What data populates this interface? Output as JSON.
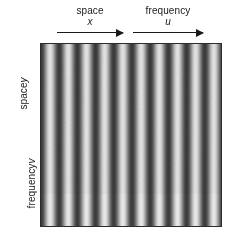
{
  "figure": {
    "background_color": "#ffffff",
    "width": 229,
    "height": 237
  },
  "top_axes": [
    {
      "name": "space-x",
      "word": "space",
      "variable": "x",
      "direction": "right",
      "arrow": {
        "x": 57,
        "y": 30,
        "length": 66
      },
      "label_center_x": 90,
      "label_top_y": 5
    },
    {
      "name": "frequency-u",
      "word": "frequency",
      "variable": "u",
      "direction": "right",
      "arrow": {
        "x": 133,
        "y": 30,
        "length": 70
      },
      "label_center_x": 168,
      "label_top_y": 5
    }
  ],
  "left_axes": [
    {
      "name": "space-y",
      "word": "space",
      "variable": "y",
      "direction": "down",
      "arrow": {
        "x": 27,
        "y": 55,
        "length": 76
      },
      "label_center_y": 95
    },
    {
      "name": "frequency-v",
      "word": "frequency",
      "variable": "v",
      "direction": "down",
      "arrow": {
        "x": 27,
        "y": 142,
        "length": 83
      },
      "label_center_y": 185
    }
  ],
  "grating": {
    "name": "vertical-sinusoidal-grating",
    "box": {
      "x": 40,
      "y": 43,
      "width": 182,
      "height": 184
    },
    "orientation": "vertical-bars",
    "period_px": 18.2,
    "cycles": 10,
    "phase_deg": 0,
    "light_gray": "#e8e8e8",
    "dark_gray": "#3a3a3a",
    "mid_gray": "#b0b0b0",
    "border_color": "#2b2b2b",
    "grain": "film-grain-noise"
  },
  "chart_data": {
    "type": "heatmap",
    "title": "",
    "xlabel": "space x / frequency u",
    "ylabel": "space y / frequency v",
    "x": [
      0,
      18.2,
      36.4,
      54.6,
      72.8,
      91,
      109.2,
      127.4,
      145.6,
      163.8,
      182
    ],
    "values": [
      1,
      1,
      1,
      1,
      1,
      1,
      1,
      1,
      1,
      1,
      1
    ],
    "cycles": 10,
    "period_px": 18.2,
    "grid": false,
    "legend": "none"
  }
}
